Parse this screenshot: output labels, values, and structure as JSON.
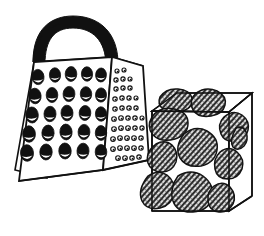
{
  "illustration": {
    "title": "Box grater and block of holey cheese",
    "style": "black and white line art, hatched shading",
    "background_color": "#ffffff",
    "ink_color": "#111111",
    "hatch_color": "#1a1a1a",
    "objects": [
      {
        "name": "box-grater",
        "label": "Box grater",
        "parts": [
          {
            "name": "handle",
            "label": "Handle",
            "fill": "#111111"
          },
          {
            "name": "top-face",
            "label": "Top face",
            "fill": "#111111",
            "texture": "diagonal-white-hatch"
          },
          {
            "name": "front-face",
            "label": "Front face",
            "fill": "#ffffff",
            "holes": "oval-blades"
          },
          {
            "name": "side-face",
            "label": "Right side face",
            "fill": "#ffffff",
            "holes": "small-round-rasp"
          }
        ],
        "front_hole_rows": 5,
        "front_hole_cols": 5,
        "side_hole_rows": 8
      },
      {
        "name": "cheese-block",
        "label": "Block of cheese",
        "parts": [
          {
            "name": "cheese-top-face",
            "label": "Top face",
            "fill": "#ffffff"
          },
          {
            "name": "cheese-front-face",
            "label": "Front face",
            "fill": "#ffffff"
          },
          {
            "name": "cheese-side-face",
            "label": "Right side face",
            "fill": "#ffffff"
          }
        ],
        "hole_count": 11,
        "hole_fill": "#4a4a4a",
        "hole_texture": "diagonal-hatch"
      }
    ]
  },
  "grater_front_holes": [
    {
      "cx": 38,
      "cy": 77,
      "rx": 6.0,
      "ry": 7.6,
      "rot": -4
    },
    {
      "cx": 55,
      "cy": 75,
      "rx": 5.6,
      "ry": 7.2,
      "rot": -3
    },
    {
      "cx": 71,
      "cy": 74,
      "rx": 5.8,
      "ry": 7.4,
      "rot": 2
    },
    {
      "cx": 87,
      "cy": 74,
      "rx": 5.6,
      "ry": 7.2,
      "rot": -2
    },
    {
      "cx": 101,
      "cy": 75,
      "rx": 5.4,
      "ry": 7.0,
      "rot": 3
    },
    {
      "cx": 35,
      "cy": 96,
      "rx": 6.1,
      "ry": 7.8,
      "rot": -5
    },
    {
      "cx": 52,
      "cy": 95,
      "rx": 5.8,
      "ry": 7.5,
      "rot": 0
    },
    {
      "cx": 69,
      "cy": 94,
      "rx": 5.9,
      "ry": 7.6,
      "rot": 3
    },
    {
      "cx": 86,
      "cy": 94,
      "rx": 5.7,
      "ry": 7.3,
      "rot": -3
    },
    {
      "cx": 101,
      "cy": 95,
      "rx": 5.5,
      "ry": 7.1,
      "rot": 2
    },
    {
      "cx": 32,
      "cy": 115,
      "rx": 6.3,
      "ry": 8.0,
      "rot": -4
    },
    {
      "cx": 50,
      "cy": 114,
      "rx": 6.0,
      "ry": 7.7,
      "rot": 2
    },
    {
      "cx": 67,
      "cy": 113,
      "rx": 6.0,
      "ry": 7.8,
      "rot": -2
    },
    {
      "cx": 85,
      "cy": 113,
      "rx": 5.8,
      "ry": 7.5,
      "rot": 4
    },
    {
      "cx": 101,
      "cy": 114,
      "rx": 5.6,
      "ry": 7.2,
      "rot": -3
    },
    {
      "cx": 29,
      "cy": 134,
      "rx": 6.4,
      "ry": 8.2,
      "rot": -3
    },
    {
      "cx": 48,
      "cy": 133,
      "rx": 6.1,
      "ry": 7.9,
      "rot": 3
    },
    {
      "cx": 66,
      "cy": 132,
      "rx": 6.1,
      "ry": 7.9,
      "rot": -4
    },
    {
      "cx": 84,
      "cy": 132,
      "rx": 5.9,
      "ry": 7.6,
      "rot": 2
    },
    {
      "cx": 101,
      "cy": 133,
      "rx": 5.7,
      "ry": 7.4,
      "rot": -2
    },
    {
      "cx": 27,
      "cy": 153,
      "rx": 6.5,
      "ry": 8.3,
      "rot": -4
    },
    {
      "cx": 46,
      "cy": 152,
      "rx": 6.2,
      "ry": 8.0,
      "rot": 2
    },
    {
      "cx": 65,
      "cy": 151,
      "rx": 6.2,
      "ry": 8.0,
      "rot": -3
    },
    {
      "cx": 83,
      "cy": 151,
      "rx": 6.0,
      "ry": 7.8,
      "rot": 3
    },
    {
      "cx": 101,
      "cy": 152,
      "rx": 5.8,
      "ry": 7.5,
      "rot": -2
    }
  ],
  "grater_side_holes": [
    {
      "cx": 117,
      "cy": 71,
      "r": 2.0
    },
    {
      "cx": 124,
      "cy": 70,
      "r": 2.0
    },
    {
      "cx": 116,
      "cy": 80,
      "r": 2.1
    },
    {
      "cx": 123,
      "cy": 79,
      "r": 2.1
    },
    {
      "cx": 130,
      "cy": 79,
      "r": 2.0
    },
    {
      "cx": 116,
      "cy": 89,
      "r": 2.1
    },
    {
      "cx": 123,
      "cy": 88,
      "r": 2.1
    },
    {
      "cx": 130,
      "cy": 88,
      "r": 2.1
    },
    {
      "cx": 115,
      "cy": 99,
      "r": 2.2
    },
    {
      "cx": 122,
      "cy": 98,
      "r": 2.2
    },
    {
      "cx": 129,
      "cy": 98,
      "r": 2.1
    },
    {
      "cx": 136,
      "cy": 98,
      "r": 2.0
    },
    {
      "cx": 115,
      "cy": 109,
      "r": 2.2
    },
    {
      "cx": 122,
      "cy": 108,
      "r": 2.2
    },
    {
      "cx": 129,
      "cy": 108,
      "r": 2.2
    },
    {
      "cx": 136,
      "cy": 108,
      "r": 2.1
    },
    {
      "cx": 114,
      "cy": 119,
      "r": 2.3
    },
    {
      "cx": 121,
      "cy": 118,
      "r": 2.3
    },
    {
      "cx": 128,
      "cy": 118,
      "r": 2.2
    },
    {
      "cx": 135,
      "cy": 118,
      "r": 2.2
    },
    {
      "cx": 142,
      "cy": 118,
      "r": 2.0
    },
    {
      "cx": 114,
      "cy": 129,
      "r": 2.3
    },
    {
      "cx": 121,
      "cy": 128,
      "r": 2.3
    },
    {
      "cx": 128,
      "cy": 128,
      "r": 2.3
    },
    {
      "cx": 135,
      "cy": 128,
      "r": 2.2
    },
    {
      "cx": 142,
      "cy": 128,
      "r": 2.1
    },
    {
      "cx": 113,
      "cy": 139,
      "r": 2.3
    },
    {
      "cx": 120,
      "cy": 138,
      "r": 2.3
    },
    {
      "cx": 127,
      "cy": 138,
      "r": 2.3
    },
    {
      "cx": 134,
      "cy": 138,
      "r": 2.3
    },
    {
      "cx": 141,
      "cy": 138,
      "r": 2.2
    },
    {
      "cx": 113,
      "cy": 149,
      "r": 2.3
    },
    {
      "cx": 120,
      "cy": 148,
      "r": 2.3
    },
    {
      "cx": 127,
      "cy": 148,
      "r": 2.3
    },
    {
      "cx": 134,
      "cy": 148,
      "r": 2.3
    },
    {
      "cx": 141,
      "cy": 148,
      "r": 2.2
    },
    {
      "cx": 118,
      "cy": 158,
      "r": 2.3
    },
    {
      "cx": 125,
      "cy": 158,
      "r": 2.3
    },
    {
      "cx": 132,
      "cy": 158,
      "r": 2.2
    },
    {
      "cx": 139,
      "cy": 157,
      "r": 2.2
    }
  ],
  "cheese_holes": [
    {
      "name": "hole-top-left",
      "d": "M160,97 q6,-9 18,-8 q12,1 14,9 q2,9 -9,13 q-12,4 -20,-2 q-6,-5 -3,-12 Z"
    },
    {
      "name": "hole-top-mid",
      "d": "M196,93 q10,-7 21,-2 q10,5 8,14 q-2,9 -14,11 q-13,2 -18,-6 q-5,-9 3,-17 Z"
    },
    {
      "name": "hole-left-upper",
      "d": "M152,117 q8,-11 22,-8 q14,3 14,14 q0,12 -13,16 q-14,4 -22,-4 q-7,-8 -1,-18 Z"
    },
    {
      "name": "hole-right-upper",
      "d": "M224,117 q9,-8 18,-2 q8,6 6,15 q-2,9 -12,11 q-11,2 -15,-7 q-4,-10 3,-17 Z"
    },
    {
      "name": "hole-center",
      "d": "M184,134 q11,-9 23,-3 q12,7 10,19 q-2,13 -16,16 q-15,2 -21,-8 q-6,-11 4,-24 Z"
    },
    {
      "name": "hole-left-mid",
      "d": "M156,144 q9,-5 16,1 q7,7 4,17 q-4,10 -14,10 q-11,0 -14,-9 q-3,-11 8,-19 Z"
    },
    {
      "name": "hole-right-mid",
      "d": "M220,152 q9,-7 17,0 q8,7 5,17 q-4,10 -14,10 q-11,0 -13,-10 q-2,-10 5,-17 Z"
    },
    {
      "name": "hole-bottom-left",
      "d": "M148,176 q10,-7 19,-1 q9,7 7,18 q-2,12 -14,15 q-13,3 -18,-7 q-5,-11 6,-25 Z"
    },
    {
      "name": "hole-bottom-center",
      "d": "M178,176 q13,-8 25,0 q12,9 9,22 q-4,13 -19,14 q-16,1 -20,-11 q-4,-13 5,-25 Z"
    },
    {
      "name": "hole-bottom-right",
      "d": "M214,186 q9,-6 16,1 q7,8 3,17 q-5,9 -14,8 q-10,-1 -11,-11 q-1,-10 6,-15 Z"
    },
    {
      "name": "hole-edge-right",
      "d": "M236,128 q7,-3 10,4 q3,8 -2,14 q-6,6 -11,1 q-4,-6 3,-19 Z"
    }
  ]
}
